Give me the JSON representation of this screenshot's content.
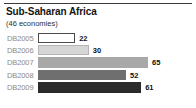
{
  "chart_data": {
    "type": "bar",
    "orientation": "horizontal",
    "title": "Sub-Saharan Africa",
    "subtitle": "(46 economies)",
    "xlabel": "",
    "ylabel": "",
    "grid": false,
    "legend": null,
    "categories": [
      "DB2005",
      "DB2006",
      "DB2007",
      "DB2008",
      "DB2009"
    ],
    "values": [
      22,
      30,
      65,
      52,
      61
    ],
    "xlim": [
      0,
      65
    ],
    "bars": [
      {
        "category": "DB2005",
        "value": 22,
        "value_label": "22",
        "fill": "#ffffff",
        "border": "#4a4a4a"
      },
      {
        "category": "DB2006",
        "value": 30,
        "value_label": "30",
        "fill": "#d6d6d6",
        "border": "#b4b4b4"
      },
      {
        "category": "DB2007",
        "value": 65,
        "value_label": "65",
        "fill": "#a8a8a8",
        "border": "#a8a8a8"
      },
      {
        "category": "DB2008",
        "value": 52,
        "value_label": "52",
        "fill": "#6f6f6f",
        "border": "#6f6f6f"
      },
      {
        "category": "DB2009",
        "value": 61,
        "value_label": "61",
        "fill": "#2b2b2b",
        "border": "#2b2b2b"
      }
    ]
  },
  "style": {
    "rule_color": "#3b3b3b",
    "label_color": "#8a8a8a",
    "value_color": "#111111",
    "background": "#ffffff"
  }
}
